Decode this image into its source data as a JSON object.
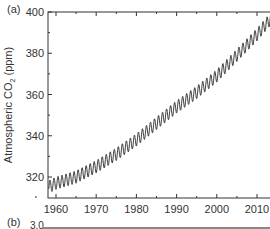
{
  "panel_a": {
    "label": "(a)"
  },
  "panel_b": {
    "label": "(b)",
    "first_tick": "3.0"
  },
  "chart_data": {
    "type": "line",
    "title": "",
    "xlabel": "",
    "ylabel": "Atmospheric CO2 (ppm)",
    "xlim": [
      1958,
      2014
    ],
    "ylim": [
      310,
      400
    ],
    "x_ticks": [
      1960,
      1970,
      1980,
      1990,
      2000,
      2010
    ],
    "y_ticks": [
      320,
      340,
      360,
      380,
      400
    ],
    "grid": false,
    "legend": null,
    "series": [
      {
        "name": "Mauna Loa CO2 (seasonal cycle)",
        "x": [
          1958,
          1960,
          1965,
          1970,
          1975,
          1980,
          1985,
          1990,
          1995,
          2000,
          2005,
          2010,
          2014
        ],
        "values": [
          315,
          317,
          320,
          325,
          331,
          338,
          346,
          354,
          361,
          369,
          379,
          389,
          398
        ],
        "seasonal_amplitude_ppm": 6
      }
    ]
  }
}
